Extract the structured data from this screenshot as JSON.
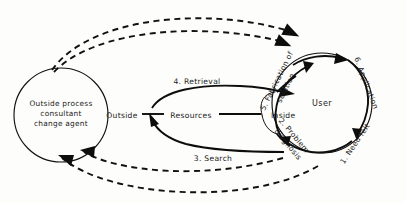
{
  "diagram": {
    "background_color": "#fdfdfb",
    "ink_color": "#111111",
    "nodes": {
      "consultant": {
        "name": "outside-process-consultant",
        "line1": "Outside process",
        "line2": "consultant",
        "line3": "change agent",
        "shape": "circle",
        "cx": 61,
        "cy": 115,
        "r": 47
      },
      "user": {
        "name": "user-system",
        "label": "User",
        "shape": "circle",
        "cx": 322,
        "cy": 103,
        "r": 50
      },
      "resources": {
        "name": "resources",
        "label": "Resources",
        "shape": "ellipse"
      }
    },
    "boundaries": {
      "outside_label": "Outside",
      "inside_label": "Inside"
    },
    "flows": [
      {
        "id": "retrieval",
        "label": "4. Retrieval",
        "direction": "left-to-right"
      },
      {
        "id": "search",
        "label": "3. Search",
        "direction": "right-to-left"
      }
    ],
    "cycle_steps": [
      {
        "order": 1,
        "label": "1. Need felt",
        "position": "bottom-right"
      },
      {
        "order": 2,
        "label": "2. Problem diagnosis",
        "position": "bottom-left"
      },
      {
        "order": 5,
        "label": "5. Fabrication of solution",
        "position": "top-left"
      },
      {
        "order": 6,
        "label": "6. Application",
        "position": "top-right"
      }
    ],
    "cycle_step_text": {
      "step1": "1. Need felt",
      "step2_line1": "2. Problem",
      "step2_line2": "diagnosis",
      "step5_line1": "5. Fabrication of",
      "step5_line2": "solution",
      "step6": "6. Application"
    },
    "dashed_links": [
      {
        "id": "top-outer",
        "from": "consultant",
        "to": "user",
        "style": "dashed",
        "arrow": "right"
      },
      {
        "id": "top-inner",
        "from": "consultant",
        "to": "user",
        "style": "dashed",
        "arrow": "right"
      },
      {
        "id": "bottom-inner",
        "from": "user",
        "to": "consultant",
        "style": "dashed",
        "arrow": "left"
      },
      {
        "id": "bottom-outer",
        "from": "user",
        "to": "consultant",
        "style": "dashed",
        "arrow": "left"
      }
    ]
  }
}
